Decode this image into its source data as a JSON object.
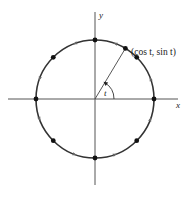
{
  "diagram": {
    "labels": {
      "x_axis": "x",
      "y_axis": "y",
      "point": "(cos t, sin t)",
      "angle": "t"
    },
    "geometry": {
      "center": [
        95,
        99
      ],
      "radius": 59,
      "point_angle_deg": 59
    },
    "marked_points_deg": [
      0,
      45,
      90,
      135,
      180,
      225,
      270,
      315
    ],
    "arrow_angles_deg": [
      20,
      70,
      110,
      160,
      200,
      250,
      290,
      340
    ],
    "colors": {
      "stroke": "#333333",
      "axis": "#555555",
      "dot": "#111111"
    }
  }
}
